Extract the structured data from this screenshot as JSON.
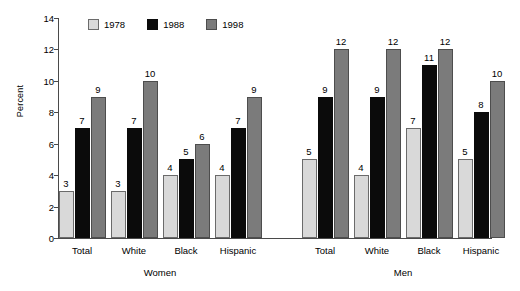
{
  "chart_data": {
    "type": "bar",
    "title": "",
    "xlabel": "",
    "ylabel": "Percent",
    "ylim": [
      0,
      14
    ],
    "yticks": [
      0,
      2,
      4,
      6,
      8,
      10,
      12,
      14
    ],
    "grid": false,
    "legend_position": "top-left",
    "series": [
      {
        "name": "1978",
        "color": "#d9d9d9",
        "values": [
          3,
          3,
          4,
          4,
          5,
          4,
          7,
          5
        ]
      },
      {
        "name": "1988",
        "color": "#0b0b0b",
        "values": [
          7,
          7,
          5,
          7,
          9,
          9,
          11,
          8
        ]
      },
      {
        "name": "1998",
        "color": "#7b7b7b",
        "values": [
          9,
          10,
          6,
          9,
          12,
          12,
          12,
          10
        ]
      }
    ],
    "categories": [
      "Total",
      "White",
      "Black",
      "Hispanic",
      "Total",
      "White",
      "Black",
      "Hispanic"
    ],
    "groups": [
      {
        "label": "Women",
        "categories": [
          "Total",
          "White",
          "Black",
          "Hispanic"
        ]
      },
      {
        "label": "Men",
        "categories": [
          "Total",
          "White",
          "Black",
          "Hispanic"
        ]
      }
    ]
  },
  "axis": {
    "y_title": "Percent",
    "y_tick_labels": [
      "0",
      "2",
      "4",
      "6",
      "8",
      "10",
      "12",
      "14"
    ]
  },
  "legend": {
    "entries": [
      {
        "label": "1978"
      },
      {
        "label": "1988"
      },
      {
        "label": "1998"
      }
    ]
  }
}
